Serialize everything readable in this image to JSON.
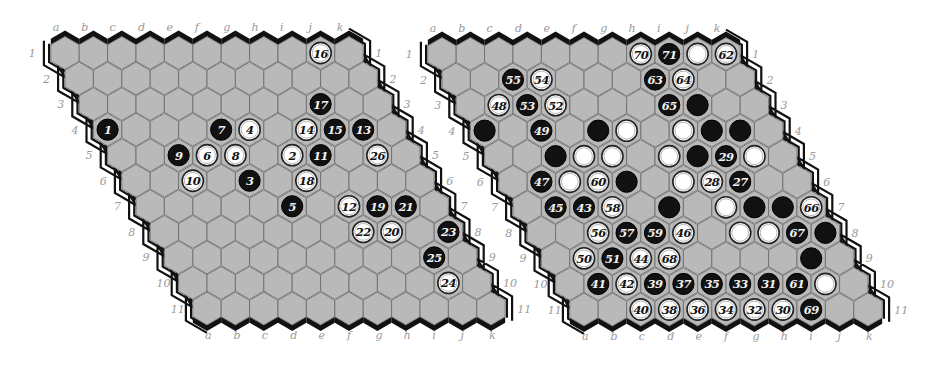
{
  "colors": {
    "cell_fill": "#b9b9b9",
    "cell_stroke": "#6e6e6e",
    "black_edge": "#111111",
    "white_edge_line": "#111111",
    "black_stone": "#111111",
    "white_stone": "#ffffff",
    "coord_text": "#9a9a9a"
  },
  "geometry": {
    "size": 11,
    "dx": 28.4,
    "dy": 25.55,
    "row_shift": 14.2,
    "hex_radius": 16.4,
    "stone_radius": 10.6
  },
  "column_labels": [
    "a",
    "b",
    "c",
    "d",
    "e",
    "f",
    "g",
    "h",
    "i",
    "j",
    "k"
  ],
  "row_labels": [
    "1",
    "2",
    "3",
    "4",
    "5",
    "6",
    "7",
    "8",
    "9",
    "10",
    "11"
  ],
  "boards": [
    {
      "id": "left-board",
      "origin": [
        65,
        53
      ],
      "stones": [
        {
          "cell": "a4",
          "color": "black",
          "label": "1"
        },
        {
          "cell": "g5",
          "color": "white",
          "label": "2"
        },
        {
          "cell": "e6",
          "color": "black",
          "label": "3"
        },
        {
          "cell": "f4",
          "color": "white",
          "label": "4"
        },
        {
          "cell": "f7",
          "color": "black",
          "label": "5"
        },
        {
          "cell": "d5",
          "color": "white",
          "label": "6"
        },
        {
          "cell": "e4",
          "color": "black",
          "label": "7"
        },
        {
          "cell": "e5",
          "color": "white",
          "label": "8"
        },
        {
          "cell": "c5",
          "color": "black",
          "label": "9"
        },
        {
          "cell": "c6",
          "color": "white",
          "label": "10"
        },
        {
          "cell": "h5",
          "color": "black",
          "label": "11"
        },
        {
          "cell": "h7",
          "color": "white",
          "label": "12"
        },
        {
          "cell": "j4",
          "color": "black",
          "label": "13"
        },
        {
          "cell": "h4",
          "color": "white",
          "label": "14"
        },
        {
          "cell": "i4",
          "color": "black",
          "label": "15"
        },
        {
          "cell": "j1",
          "color": "white",
          "label": "16"
        },
        {
          "cell": "i3",
          "color": "black",
          "label": "17"
        },
        {
          "cell": "g6",
          "color": "white",
          "label": "18"
        },
        {
          "cell": "i7",
          "color": "black",
          "label": "19"
        },
        {
          "cell": "i8",
          "color": "white",
          "label": "20"
        },
        {
          "cell": "j7",
          "color": "black",
          "label": "21"
        },
        {
          "cell": "h8",
          "color": "white",
          "label": "22"
        },
        {
          "cell": "k8",
          "color": "black",
          "label": "23"
        },
        {
          "cell": "j10",
          "color": "white",
          "label": "24"
        },
        {
          "cell": "j9",
          "color": "black",
          "label": "25"
        },
        {
          "cell": "j5",
          "color": "white",
          "label": "26"
        }
      ]
    },
    {
      "id": "right-board",
      "origin": [
        442,
        54
      ],
      "stones": [
        {
          "cell": "a4",
          "color": "black",
          "label": ""
        },
        {
          "cell": "e4",
          "color": "black",
          "label": ""
        },
        {
          "cell": "f4",
          "color": "white",
          "label": ""
        },
        {
          "cell": "h4",
          "color": "white",
          "label": ""
        },
        {
          "cell": "i4",
          "color": "black",
          "label": ""
        },
        {
          "cell": "j4",
          "color": "black",
          "label": ""
        },
        {
          "cell": "c5",
          "color": "black",
          "label": ""
        },
        {
          "cell": "d5",
          "color": "white",
          "label": ""
        },
        {
          "cell": "e5",
          "color": "white",
          "label": ""
        },
        {
          "cell": "g5",
          "color": "white",
          "label": ""
        },
        {
          "cell": "h5",
          "color": "black",
          "label": ""
        },
        {
          "cell": "j5",
          "color": "white",
          "label": ""
        },
        {
          "cell": "c6",
          "color": "white",
          "label": ""
        },
        {
          "cell": "e6",
          "color": "black",
          "label": ""
        },
        {
          "cell": "g6",
          "color": "white",
          "label": ""
        },
        {
          "cell": "f7",
          "color": "black",
          "label": ""
        },
        {
          "cell": "h7",
          "color": "white",
          "label": ""
        },
        {
          "cell": "i7",
          "color": "black",
          "label": ""
        },
        {
          "cell": "j7",
          "color": "black",
          "label": ""
        },
        {
          "cell": "h8",
          "color": "white",
          "label": ""
        },
        {
          "cell": "i8",
          "color": "white",
          "label": ""
        },
        {
          "cell": "k8",
          "color": "black",
          "label": ""
        },
        {
          "cell": "j9",
          "color": "black",
          "label": ""
        },
        {
          "cell": "i3",
          "color": "black",
          "label": ""
        },
        {
          "cell": "j1",
          "color": "white",
          "label": ""
        },
        {
          "cell": "j10",
          "color": "white",
          "label": ""
        },
        {
          "cell": "i6",
          "color": "black",
          "label": "27"
        },
        {
          "cell": "h6",
          "color": "white",
          "label": "28"
        },
        {
          "cell": "i5",
          "color": "black",
          "label": "29"
        },
        {
          "cell": "h11",
          "color": "white",
          "label": "30"
        },
        {
          "cell": "h10",
          "color": "black",
          "label": "31"
        },
        {
          "cell": "g11",
          "color": "white",
          "label": "32"
        },
        {
          "cell": "g10",
          "color": "black",
          "label": "33"
        },
        {
          "cell": "f11",
          "color": "white",
          "label": "34"
        },
        {
          "cell": "f10",
          "color": "black",
          "label": "35"
        },
        {
          "cell": "e11",
          "color": "white",
          "label": "36"
        },
        {
          "cell": "e10",
          "color": "black",
          "label": "37"
        },
        {
          "cell": "d11",
          "color": "white",
          "label": "38"
        },
        {
          "cell": "d10",
          "color": "black",
          "label": "39"
        },
        {
          "cell": "c11",
          "color": "white",
          "label": "40"
        },
        {
          "cell": "b10",
          "color": "black",
          "label": "41"
        },
        {
          "cell": "c10",
          "color": "white",
          "label": "42"
        },
        {
          "cell": "c7",
          "color": "black",
          "label": "43"
        },
        {
          "cell": "d9",
          "color": "white",
          "label": "44"
        },
        {
          "cell": "b7",
          "color": "black",
          "label": "45"
        },
        {
          "cell": "f8",
          "color": "white",
          "label": "46"
        },
        {
          "cell": "b6",
          "color": "black",
          "label": "47"
        },
        {
          "cell": "b3",
          "color": "white",
          "label": "48"
        },
        {
          "cell": "c4",
          "color": "black",
          "label": "49"
        },
        {
          "cell": "b9",
          "color": "white",
          "label": "50"
        },
        {
          "cell": "c9",
          "color": "black",
          "label": "51"
        },
        {
          "cell": "d3",
          "color": "white",
          "label": "52"
        },
        {
          "cell": "c3",
          "color": "black",
          "label": "53"
        },
        {
          "cell": "d2",
          "color": "white",
          "label": "54"
        },
        {
          "cell": "c2",
          "color": "black",
          "label": "55"
        },
        {
          "cell": "c8",
          "color": "white",
          "label": "56"
        },
        {
          "cell": "d8",
          "color": "black",
          "label": "57"
        },
        {
          "cell": "d7",
          "color": "white",
          "label": "58"
        },
        {
          "cell": "e8",
          "color": "black",
          "label": "59"
        },
        {
          "cell": "d6",
          "color": "white",
          "label": "60"
        },
        {
          "cell": "i10",
          "color": "black",
          "label": "61"
        },
        {
          "cell": "k1",
          "color": "white",
          "label": "62"
        },
        {
          "cell": "h2",
          "color": "black",
          "label": "63"
        },
        {
          "cell": "i2",
          "color": "white",
          "label": "64"
        },
        {
          "cell": "h3",
          "color": "black",
          "label": "65"
        },
        {
          "cell": "k7",
          "color": "white",
          "label": "66"
        },
        {
          "cell": "j8",
          "color": "black",
          "label": "67"
        },
        {
          "cell": "e9",
          "color": "white",
          "label": "68"
        },
        {
          "cell": "i11",
          "color": "black",
          "label": "69"
        },
        {
          "cell": "h1",
          "color": "white",
          "label": "70"
        },
        {
          "cell": "i1",
          "color": "black",
          "label": "71"
        }
      ]
    }
  ]
}
